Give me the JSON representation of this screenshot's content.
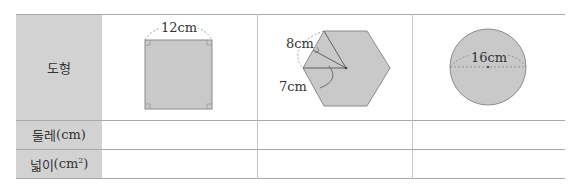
{
  "table": {
    "row_headers": [
      {
        "label": "도형"
      },
      {
        "label_main": "둘레",
        "label_unit": "(cm)"
      },
      {
        "label_main": "넓이",
        "label_unit": "(cm",
        "label_sup": "2",
        "label_close": ")"
      }
    ],
    "figures": [
      {
        "shape": "square",
        "side_label": "12cm"
      },
      {
        "shape": "regular-hexagon",
        "side_label": "8cm",
        "apothem_label": "7cm"
      },
      {
        "shape": "circle",
        "diameter_label": "16cm"
      }
    ],
    "perimeter_answers": [
      "",
      "",
      ""
    ],
    "area_answers": [
      "",
      "",
      ""
    ]
  },
  "colors": {
    "header_fill": "#d2d2d2",
    "shape_fill": "#c9c9c9",
    "shape_stroke": "#8a8a8a",
    "line": "#a8a8a8"
  }
}
